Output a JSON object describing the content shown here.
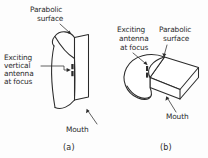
{
  "figure": {
    "background_color": "#fdfdfd",
    "ink_color": "#2b2b2b",
    "panels": [
      {
        "id": "a",
        "caption": "(a)",
        "labels": {
          "parabolic_surface": "Parabolic\nsurface",
          "parabolic_surface_line1": "Parabolic",
          "parabolic_surface_line2": "surface",
          "exciting_antenna_line1": "Exciting",
          "exciting_antenna_line2": "vertical",
          "exciting_antenna_line3": "antenna",
          "exciting_antenna_line4": "at focus",
          "mouth": "Mouth"
        }
      },
      {
        "id": "b",
        "caption": "(b)",
        "labels": {
          "exciting_antenna_line1": "Exciting",
          "exciting_antenna_line2": "antenna",
          "exciting_antenna_line3": "at focus",
          "parabolic_surface_line1": "Parabolic",
          "parabolic_surface_line2": "surface",
          "mouth": "Mouth"
        }
      }
    ]
  }
}
